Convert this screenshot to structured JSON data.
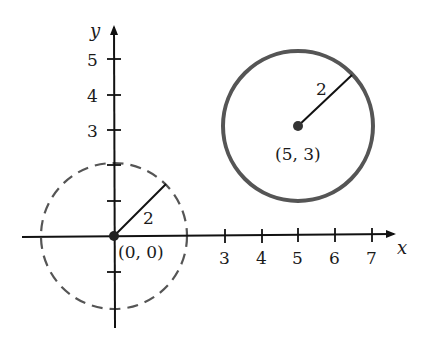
{
  "axes": {
    "x_label": "x",
    "y_label": "y",
    "x_ticks": [
      {
        "value": 3,
        "label": "3"
      },
      {
        "value": 4,
        "label": "4"
      },
      {
        "value": 5,
        "label": "5"
      },
      {
        "value": 6,
        "label": "6"
      },
      {
        "value": 7,
        "label": "7"
      }
    ],
    "y_ticks": [
      {
        "value": 3,
        "label": "3"
      },
      {
        "value": 4,
        "label": "4"
      },
      {
        "value": 5,
        "label": "5"
      }
    ]
  },
  "circles": [
    {
      "name": "dashed-circle-origin",
      "center_label": "(0, 0)",
      "radius_label": "2",
      "style": "dashed",
      "color": "#555555"
    },
    {
      "name": "solid-circle-5-3",
      "center_label": "(5, 3)",
      "radius_label": "2",
      "style": "solid",
      "color": "#555555"
    }
  ]
}
